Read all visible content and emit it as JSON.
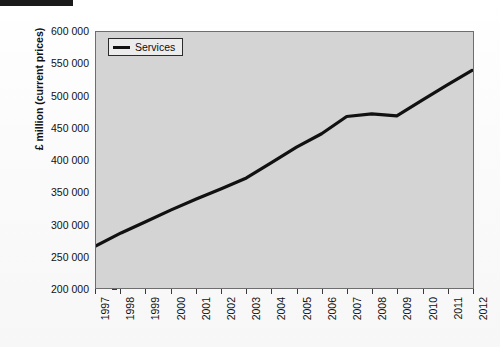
{
  "page": {
    "redaction_bar": "",
    "bleed_text": "the increase in output across the service industries and the related measures of turnover recorded for the period under review were broadly consistent with the national accounts estimates published alongside this release and summarised in table 4 of the statistical bulletin for the reference period"
  },
  "legend": {
    "position": "top-left-inside",
    "entries": [
      {
        "label": "Services",
        "color": "#111111",
        "marker": "line"
      }
    ]
  },
  "chart_data": {
    "type": "line",
    "title": "",
    "subtitle": "",
    "xlabel": "",
    "ylabel": "£ million (current prices)",
    "x": [
      1997,
      1998,
      1999,
      2000,
      2001,
      2002,
      2003,
      2004,
      2005,
      2006,
      2007,
      2008,
      2009,
      2010,
      2011,
      2012
    ],
    "categories": [
      "1997",
      "1998",
      "1999",
      "2000",
      "2001",
      "2002",
      "2003",
      "2004",
      "2005",
      "2006",
      "2007",
      "2008",
      "2009",
      "2010",
      "2011",
      "2012"
    ],
    "series": [
      {
        "name": "Services",
        "color": "#111111",
        "values": [
          266000,
          286000,
          304000,
          322000,
          339000,
          355000,
          372000,
          396000,
          420000,
          441000,
          468000,
          472000,
          469000,
          493000,
          517000,
          540000
        ]
      }
    ],
    "ylim": [
      200000,
      600000
    ],
    "ytick_step": 50000,
    "ytick_labels": [
      "200 000",
      "250 000",
      "300 000",
      "350 000",
      "400 000",
      "450 000",
      "500 000",
      "550 000",
      "600 000"
    ],
    "ytick_values": [
      200000,
      250000,
      300000,
      350000,
      400000,
      450000,
      500000,
      550000,
      600000
    ],
    "xtick_labels": [
      "1997",
      "1998",
      "1999",
      "2000",
      "2001",
      "2002",
      "2003",
      "2004",
      "2005",
      "2006",
      "2007",
      "2008",
      "2009",
      "2010",
      "2011",
      "2012"
    ],
    "grid": false,
    "legend_position": "upper left",
    "plot_background": "#d4d4d4",
    "axis_color": "#6e6e6e"
  }
}
